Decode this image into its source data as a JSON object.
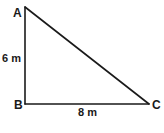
{
  "figure": {
    "type": "right-triangle",
    "vertices": [
      {
        "id": "A",
        "label": "A",
        "x": 25,
        "y": 7
      },
      {
        "id": "B",
        "label": "B",
        "x": 25,
        "y": 104
      },
      {
        "id": "C",
        "label": "C",
        "x": 149,
        "y": 104
      }
    ],
    "sides": [
      {
        "id": "AB",
        "from": "A",
        "to": "B",
        "length_label": "6 m"
      },
      {
        "id": "BC",
        "from": "B",
        "to": "C",
        "length_label": "8 m"
      },
      {
        "id": "AC",
        "from": "A",
        "to": "C",
        "length_label": ""
      }
    ],
    "right_angle_at": "B",
    "stroke_color": "#1a1a1a",
    "background_color": "#ffffff"
  },
  "labels": {
    "vertex_a": "A",
    "vertex_b": "B",
    "vertex_c": "C",
    "side_ab": "6 m",
    "side_bc": "8 m"
  }
}
